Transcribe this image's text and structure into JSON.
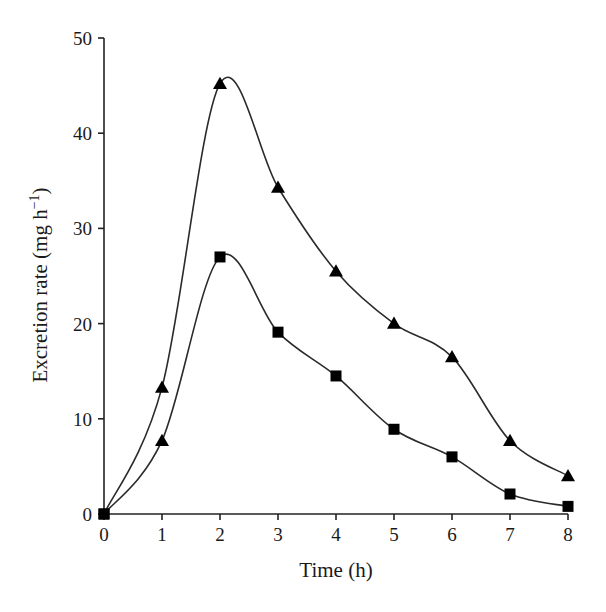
{
  "chart_data": {
    "type": "line",
    "title": "",
    "xlabel": "Time (h)",
    "ylabel": "Excretion rate (mg h⁻¹)",
    "xlim": [
      0,
      8
    ],
    "ylim": [
      0,
      50
    ],
    "x": [
      0,
      1,
      2,
      3,
      4,
      5,
      6,
      7,
      8
    ],
    "x_ticks": [
      "0",
      "1",
      "2",
      "3",
      "4",
      "5",
      "6",
      "7",
      "8"
    ],
    "y_ticks": [
      "0",
      "10",
      "20",
      "30",
      "40",
      "50"
    ],
    "grid": false,
    "legend": null,
    "series": [
      {
        "name": "upper (triangles)",
        "marker": "triangle",
        "smooth": true,
        "values": [
          0,
          13.3,
          45.2,
          34.3,
          25.5,
          20.0,
          16.5,
          7.7,
          4.0
        ],
        "markers": [
          "square",
          "triangle",
          "triangle",
          "triangle",
          "triangle",
          "triangle",
          "triangle",
          "triangle",
          "triangle"
        ]
      },
      {
        "name": "lower (squares)",
        "marker": "square",
        "smooth": true,
        "values": [
          0,
          7.7,
          27.0,
          19.1,
          14.5,
          8.9,
          6.0,
          2.1,
          0.8
        ],
        "markers": [
          "square",
          "triangle",
          "square",
          "square",
          "square",
          "square",
          "square",
          "square",
          "square"
        ]
      }
    ]
  },
  "colors": {
    "line": "#2a2a2a",
    "marker": "#000000",
    "background": "#ffffff"
  }
}
